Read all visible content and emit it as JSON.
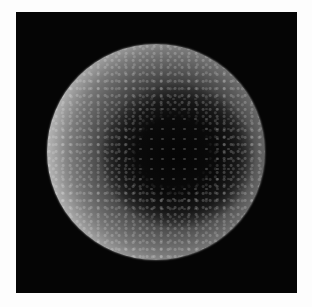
{
  "image": {
    "description": "Grayscale electron micrograph of a spherical particle with bright smooth rim and dark textured center on black background",
    "colors": {
      "page_background": "#fdfdfd",
      "frame_background": "#050505",
      "rim": "#f2f2f2",
      "center": "#050505"
    }
  }
}
